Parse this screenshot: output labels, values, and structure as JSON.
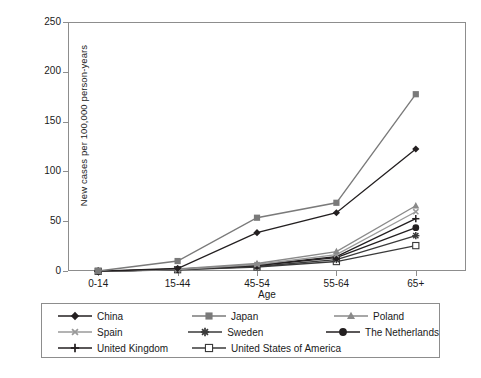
{
  "chart_data": {
    "type": "line",
    "title": "",
    "xlabel": "Age",
    "ylabel": "New cases per 100,000 person-years",
    "categories": [
      "0-14",
      "15-44",
      "45-54",
      "55-64",
      "65+"
    ],
    "ylim": [
      0,
      250
    ],
    "yticks": [
      0,
      50,
      100,
      150,
      200,
      250
    ],
    "grid": false,
    "legend_position": "below-plot",
    "series": [
      {
        "name": "China",
        "values": [
          0.3,
          3.0,
          39.0,
          59.0,
          123.0
        ],
        "marker": "diamond-filled",
        "color": "#231f20"
      },
      {
        "name": "Japan",
        "values": [
          0.5,
          10.5,
          54.0,
          69.0,
          178.0
        ],
        "marker": "square-filled",
        "color": "#7a7a7a"
      },
      {
        "name": "Poland",
        "values": [
          0.2,
          2.5,
          8.0,
          20.0,
          66.0
        ],
        "marker": "triangle-filled",
        "color": "#8a8a8a"
      },
      {
        "name": "Spain",
        "values": [
          0.2,
          2.0,
          7.0,
          17.0,
          60.0
        ],
        "marker": "x-cross",
        "color": "#9a9a9a"
      },
      {
        "name": "Sweden",
        "values": [
          0.2,
          2.0,
          5.0,
          12.0,
          36.0
        ],
        "marker": "asterisk",
        "color": "#3a3a3a"
      },
      {
        "name": "The Netherlands",
        "values": [
          0.2,
          2.2,
          6.0,
          14.0,
          44.0
        ],
        "marker": "circle-filled",
        "color": "#231f20"
      },
      {
        "name": "United Kingdom",
        "values": [
          0.2,
          2.3,
          6.5,
          15.0,
          53.0
        ],
        "marker": "plus-cross",
        "color": "#231f20"
      },
      {
        "name": "United States of America",
        "values": [
          0.2,
          1.8,
          4.5,
          10.0,
          26.0
        ],
        "marker": "square-open",
        "color": "#3a3a3a"
      }
    ]
  },
  "legend": {
    "rows": [
      [
        "China",
        "Japan",
        "Poland"
      ],
      [
        "Spain",
        "Sweden",
        "The Netherlands"
      ],
      [
        "United Kingdom",
        "United States of America",
        ""
      ]
    ]
  }
}
